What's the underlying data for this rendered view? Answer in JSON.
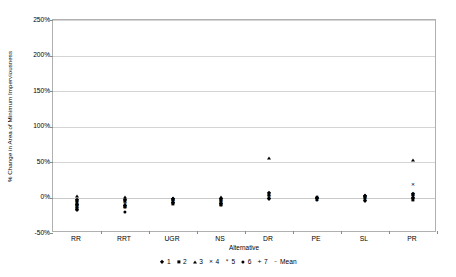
{
  "chart_data": {
    "type": "scatter",
    "title": "",
    "xlabel": "Alternative",
    "ylabel": "% Change in Area of Minimum Imperviousness",
    "categories": [
      "RR",
      "RRT",
      "UGR",
      "NS",
      "DR",
      "PE",
      "SL",
      "PR"
    ],
    "ylim": [
      -50,
      250
    ],
    "yticks": [
      -50,
      0,
      50,
      100,
      150,
      200,
      250
    ],
    "ytick_labels": [
      "-50%",
      "0%",
      "50%",
      "100%",
      "150%",
      "200%",
      "250%"
    ],
    "grid": true,
    "legend_position": "bottom",
    "series": [
      {
        "name": "1",
        "marker": "diamond",
        "values": [
          -9,
          -10,
          -4,
          -5,
          3,
          -1,
          -1,
          1
        ]
      },
      {
        "name": "2",
        "marker": "square",
        "values": [
          -11,
          -8,
          -5,
          -6,
          1,
          -2,
          0,
          2
        ]
      },
      {
        "name": "3",
        "marker": "triangle",
        "values": [
          1,
          0,
          -3,
          -3,
          55,
          0,
          3,
          53
        ]
      },
      {
        "name": "4",
        "marker": "cross",
        "values": [
          -13,
          -12,
          -6,
          -7,
          5,
          -1,
          -2,
          18
        ]
      },
      {
        "name": "5",
        "marker": "star",
        "values": [
          -8,
          -9,
          -4,
          -4,
          2,
          0,
          1,
          3
        ]
      },
      {
        "name": "6",
        "marker": "circle",
        "values": [
          -12,
          -20,
          -5,
          -8,
          4,
          -1,
          -3,
          0
        ]
      },
      {
        "name": "7",
        "marker": "plus",
        "values": [
          -10,
          -11,
          -4,
          -6,
          2,
          -1,
          0,
          2
        ]
      },
      {
        "name": "Mean",
        "marker": "dash",
        "values": [
          -9,
          -10,
          -4,
          -5,
          10,
          -1,
          0,
          11
        ]
      }
    ],
    "point_clouds": [
      {
        "category": "RR",
        "points": [
          {
            "marker": "triangle",
            "value": 2
          },
          {
            "marker": "diamond",
            "value": -3
          },
          {
            "marker": "square",
            "value": -5
          },
          {
            "marker": "star",
            "value": -6
          },
          {
            "marker": "plus",
            "value": -7
          },
          {
            "marker": "circle",
            "value": -8
          },
          {
            "marker": "dash",
            "value": -9
          },
          {
            "marker": "diamond",
            "value": -10
          },
          {
            "marker": "square",
            "value": -11
          },
          {
            "marker": "cross",
            "value": -12
          },
          {
            "marker": "circle",
            "value": -13
          },
          {
            "marker": "star",
            "value": -14
          },
          {
            "marker": "plus",
            "value": -15
          },
          {
            "marker": "square",
            "value": -16
          },
          {
            "marker": "diamond",
            "value": -17
          }
        ]
      },
      {
        "category": "RRT",
        "points": [
          {
            "marker": "triangle",
            "value": 1
          },
          {
            "marker": "diamond",
            "value": -3
          },
          {
            "marker": "square",
            "value": -5
          },
          {
            "marker": "star",
            "value": -7
          },
          {
            "marker": "plus",
            "value": -8
          },
          {
            "marker": "dash",
            "value": -9
          },
          {
            "marker": "circle",
            "value": -10
          },
          {
            "marker": "cross",
            "value": -11
          },
          {
            "marker": "diamond",
            "value": -12
          },
          {
            "marker": "square",
            "value": -13
          },
          {
            "marker": "star",
            "value": -14
          },
          {
            "marker": "plus",
            "value": -15
          },
          {
            "marker": "circle",
            "value": -20
          }
        ]
      },
      {
        "category": "UGR",
        "points": [
          {
            "marker": "triangle",
            "value": 0
          },
          {
            "marker": "diamond",
            "value": -2
          },
          {
            "marker": "square",
            "value": -3
          },
          {
            "marker": "star",
            "value": -4
          },
          {
            "marker": "plus",
            "value": -5
          },
          {
            "marker": "dash",
            "value": -5
          },
          {
            "marker": "circle",
            "value": -6
          },
          {
            "marker": "cross",
            "value": -7
          },
          {
            "marker": "diamond",
            "value": -8
          },
          {
            "marker": "square",
            "value": -9
          },
          {
            "marker": "star",
            "value": -10
          }
        ]
      },
      {
        "category": "NS",
        "points": [
          {
            "marker": "triangle",
            "value": 1
          },
          {
            "marker": "diamond",
            "value": -2
          },
          {
            "marker": "square",
            "value": -3
          },
          {
            "marker": "star",
            "value": -4
          },
          {
            "marker": "plus",
            "value": -5
          },
          {
            "marker": "dash",
            "value": -6
          },
          {
            "marker": "circle",
            "value": -7
          },
          {
            "marker": "cross",
            "value": -8
          },
          {
            "marker": "diamond",
            "value": -9
          },
          {
            "marker": "square",
            "value": -10
          },
          {
            "marker": "star",
            "value": -11
          },
          {
            "marker": "plus",
            "value": -12
          }
        ]
      },
      {
        "category": "DR",
        "points": [
          {
            "marker": "triangle",
            "value": 55
          },
          {
            "marker": "diamond",
            "value": 6
          },
          {
            "marker": "square",
            "value": 4
          },
          {
            "marker": "star",
            "value": 3
          },
          {
            "marker": "plus",
            "value": 2
          },
          {
            "marker": "dash",
            "value": 1
          },
          {
            "marker": "circle",
            "value": 0
          },
          {
            "marker": "cross",
            "value": -1
          },
          {
            "marker": "diamond",
            "value": -2
          }
        ]
      },
      {
        "category": "PE",
        "points": [
          {
            "marker": "triangle",
            "value": 1
          },
          {
            "marker": "diamond",
            "value": 0
          },
          {
            "marker": "square",
            "value": -1
          },
          {
            "marker": "star",
            "value": -1
          },
          {
            "marker": "plus",
            "value": -2
          },
          {
            "marker": "dash",
            "value": -2
          },
          {
            "marker": "circle",
            "value": -3
          },
          {
            "marker": "cross",
            "value": -4
          }
        ]
      },
      {
        "category": "SL",
        "points": [
          {
            "marker": "triangle",
            "value": 4
          },
          {
            "marker": "diamond",
            "value": 2
          },
          {
            "marker": "square",
            "value": 1
          },
          {
            "marker": "star",
            "value": 0
          },
          {
            "marker": "plus",
            "value": 0
          },
          {
            "marker": "dash",
            "value": -1
          },
          {
            "marker": "circle",
            "value": -2
          },
          {
            "marker": "cross",
            "value": -3
          },
          {
            "marker": "diamond",
            "value": -5
          }
        ]
      },
      {
        "category": "PR",
        "points": [
          {
            "marker": "triangle",
            "value": 53
          },
          {
            "marker": "cross",
            "value": 18
          },
          {
            "marker": "diamond",
            "value": 5
          },
          {
            "marker": "square",
            "value": 4
          },
          {
            "marker": "star",
            "value": 3
          },
          {
            "marker": "plus",
            "value": 2
          },
          {
            "marker": "dash",
            "value": 1
          },
          {
            "marker": "circle",
            "value": 0
          },
          {
            "marker": "diamond",
            "value": -1
          },
          {
            "marker": "square",
            "value": -3
          }
        ]
      }
    ],
    "legend": [
      {
        "label": "1",
        "marker": "diamond"
      },
      {
        "label": "2",
        "marker": "square"
      },
      {
        "label": "3",
        "marker": "triangle"
      },
      {
        "label": "4",
        "marker": "cross"
      },
      {
        "label": "5",
        "marker": "star"
      },
      {
        "label": "6",
        "marker": "circle"
      },
      {
        "label": "7",
        "marker": "plus"
      },
      {
        "label": "Mean",
        "marker": "dash"
      }
    ]
  },
  "colors": {
    "marker": "#000000",
    "gridline": "#d4d4d4",
    "frame": "#b0b0b0",
    "background": "#ffffff"
  }
}
